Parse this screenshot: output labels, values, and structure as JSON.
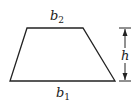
{
  "diagram": {
    "type": "trapezoid",
    "labels": {
      "top_base": "b",
      "top_base_sub": "2",
      "bottom_base": "b",
      "bottom_base_sub": "1",
      "height": "h"
    },
    "colors": {
      "stroke": "#222222",
      "background": "#ffffff"
    }
  }
}
